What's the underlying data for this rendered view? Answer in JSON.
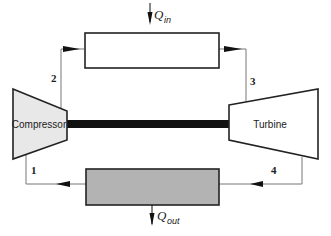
{
  "diagram": {
    "components": {
      "compressor": {
        "label": "Compressor",
        "fill": "#e8e8e8"
      },
      "turbine": {
        "label": "Turbine",
        "fill": "#ffffff"
      },
      "heat_addition_exchanger": {
        "fill": "#ffffff"
      },
      "heat_rejection_exchanger": {
        "fill": "#b3b3b3"
      },
      "shaft": {
        "color": "#111111"
      }
    },
    "heat_flows": {
      "q_in": {
        "symbol": "Q",
        "subscript": "in"
      },
      "q_out": {
        "symbol": "Q",
        "subscript": "out"
      }
    },
    "states": [
      "1",
      "2",
      "3",
      "4"
    ],
    "colors": {
      "outline": "#222222",
      "pipe": "#777777"
    }
  }
}
